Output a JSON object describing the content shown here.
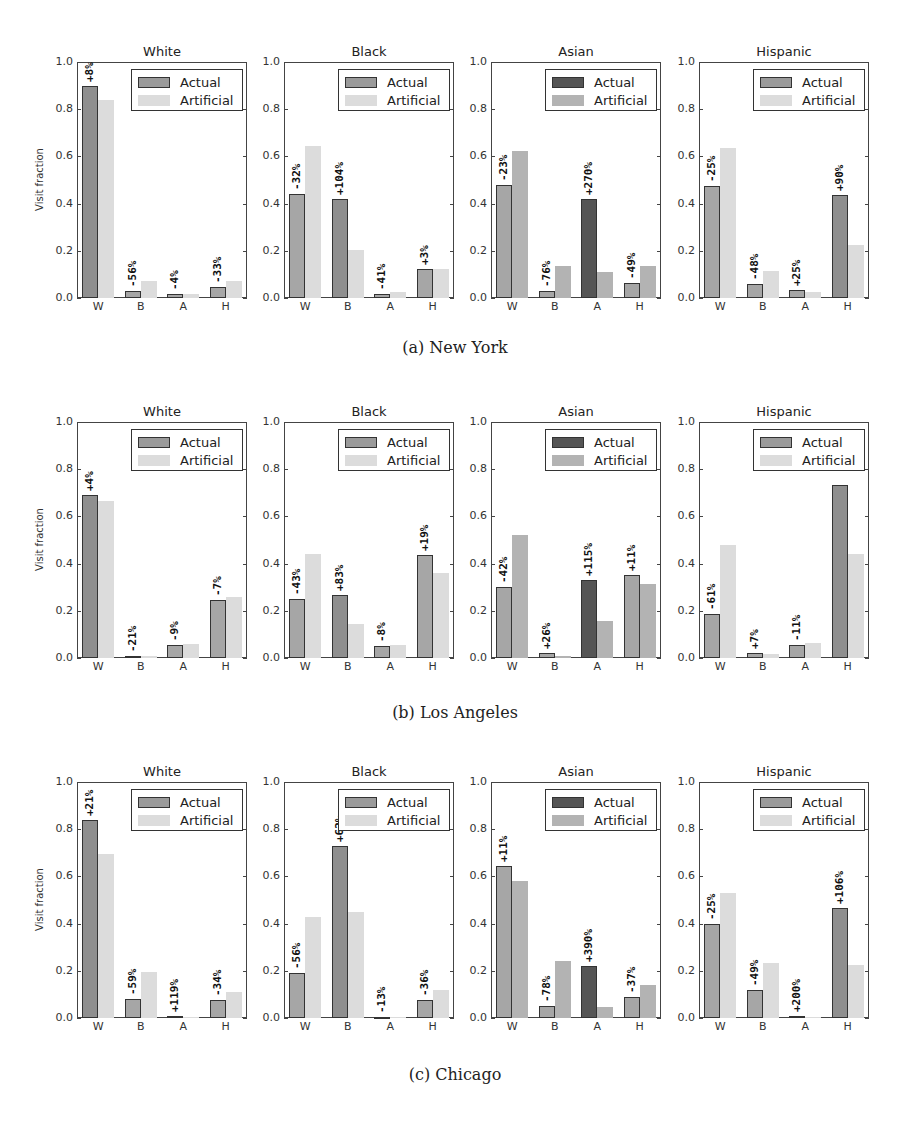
{
  "colors": {
    "actual": "#a6a6a6",
    "actual_highlight": "#555555",
    "artificial": "#dcdcdc",
    "artificial_on_highlight": "#b3b3b3"
  },
  "legend": {
    "actual": "Actual",
    "artificial": "Artificial"
  },
  "ylabel": "Visit fraction",
  "yticks": [
    "0.0",
    "0.2",
    "0.4",
    "0.6",
    "0.8",
    "1.0"
  ],
  "xticks": [
    "W",
    "B",
    "A",
    "H"
  ],
  "captions": [
    "(a) New York",
    "(b) Los Angeles",
    "(c) Chicago"
  ],
  "chart_data": [
    {
      "type": "bar",
      "city": "New York",
      "title": "White",
      "xlabel": "",
      "ylabel": "Visit fraction",
      "ylim": [
        0,
        1
      ],
      "categories": [
        "W",
        "B",
        "A",
        "H"
      ],
      "series": [
        {
          "name": "Actual",
          "values": [
            0.9,
            0.03,
            0.015,
            0.045
          ]
        },
        {
          "name": "Artificial",
          "values": [
            0.84,
            0.07,
            0.015,
            0.07
          ]
        }
      ],
      "annotations": [
        "+8%",
        "-56%",
        "-4%",
        "-33%"
      ],
      "highlight": 0,
      "legend_position": "upper right"
    },
    {
      "type": "bar",
      "city": "New York",
      "title": "Black",
      "ylim": [
        0,
        1
      ],
      "categories": [
        "W",
        "B",
        "A",
        "H"
      ],
      "series": [
        {
          "name": "Actual",
          "values": [
            0.44,
            0.42,
            0.015,
            0.125
          ]
        },
        {
          "name": "Artificial",
          "values": [
            0.645,
            0.205,
            0.025,
            0.125
          ]
        }
      ],
      "annotations": [
        "-32%",
        "+104%",
        "-41%",
        "+3%"
      ],
      "highlight": 1,
      "legend_position": "upper right"
    },
    {
      "type": "bar",
      "city": "New York",
      "title": "Asian",
      "ylim": [
        0,
        1
      ],
      "categories": [
        "W",
        "B",
        "A",
        "H"
      ],
      "series": [
        {
          "name": "Actual",
          "values": [
            0.48,
            0.03,
            0.42,
            0.065
          ]
        },
        {
          "name": "Artificial",
          "values": [
            0.625,
            0.135,
            0.11,
            0.135
          ]
        }
      ],
      "annotations": [
        "-23%",
        "-76%",
        "+270%",
        "-49%"
      ],
      "highlight": 2,
      "legend_position": "upper right"
    },
    {
      "type": "bar",
      "city": "New York",
      "title": "Hispanic",
      "ylim": [
        0,
        1
      ],
      "categories": [
        "W",
        "B",
        "A",
        "H"
      ],
      "series": [
        {
          "name": "Actual",
          "values": [
            0.475,
            0.06,
            0.035,
            0.435
          ]
        },
        {
          "name": "Artificial",
          "values": [
            0.635,
            0.115,
            0.025,
            0.225
          ]
        }
      ],
      "annotations": [
        "-25%",
        "-48%",
        "+25%",
        "+90%"
      ],
      "highlight": 3,
      "legend_position": "upper right"
    },
    {
      "type": "bar",
      "city": "Los Angeles",
      "title": "White",
      "ylim": [
        0,
        1
      ],
      "categories": [
        "W",
        "B",
        "A",
        "H"
      ],
      "series": [
        {
          "name": "Actual",
          "values": [
            0.69,
            0.01,
            0.055,
            0.245
          ]
        },
        {
          "name": "Artificial",
          "values": [
            0.665,
            0.01,
            0.06,
            0.26
          ]
        }
      ],
      "annotations": [
        "+4%",
        "-21%",
        "-9%",
        "-7%"
      ],
      "highlight": 0,
      "legend_position": "upper right"
    },
    {
      "type": "bar",
      "city": "Los Angeles",
      "title": "Black",
      "ylim": [
        0,
        1
      ],
      "categories": [
        "W",
        "B",
        "A",
        "H"
      ],
      "series": [
        {
          "name": "Actual",
          "values": [
            0.25,
            0.265,
            0.05,
            0.435
          ]
        },
        {
          "name": "Artificial",
          "values": [
            0.44,
            0.145,
            0.055,
            0.36
          ]
        }
      ],
      "annotations": [
        "-43%",
        "+83%",
        "-8%",
        "+19%"
      ],
      "highlight": 1,
      "legend_position": "upper right"
    },
    {
      "type": "bar",
      "city": "Los Angeles",
      "title": "Asian",
      "ylim": [
        0,
        1
      ],
      "categories": [
        "W",
        "B",
        "A",
        "H"
      ],
      "series": [
        {
          "name": "Actual",
          "values": [
            0.3,
            0.02,
            0.33,
            0.35
          ]
        },
        {
          "name": "Artificial",
          "values": [
            0.52,
            0.01,
            0.155,
            0.315
          ]
        }
      ],
      "annotations": [
        "-42%",
        "+26%",
        "+115%",
        "+11%"
      ],
      "highlight": 2,
      "legend_position": "upper right"
    },
    {
      "type": "bar",
      "city": "Los Angeles",
      "title": "Hispanic",
      "ylim": [
        0,
        1
      ],
      "categories": [
        "W",
        "B",
        "A",
        "H"
      ],
      "series": [
        {
          "name": "Actual",
          "values": [
            0.185,
            0.02,
            0.055,
            0.735
          ]
        },
        {
          "name": "Artificial",
          "values": [
            0.48,
            0.015,
            0.065,
            0.44
          ]
        }
      ],
      "annotations": [
        "-61%",
        "+7%",
        "-11%",
        ""
      ],
      "highlight": 3,
      "legend_position": "upper right"
    },
    {
      "type": "bar",
      "city": "Chicago",
      "title": "White",
      "ylim": [
        0,
        1
      ],
      "categories": [
        "W",
        "B",
        "A",
        "H"
      ],
      "series": [
        {
          "name": "Actual",
          "values": [
            0.84,
            0.08,
            0.01,
            0.075
          ]
        },
        {
          "name": "Artificial",
          "values": [
            0.695,
            0.195,
            0.005,
            0.11
          ]
        }
      ],
      "annotations": [
        "+21%",
        "-59%",
        "+119%",
        "-34%"
      ],
      "highlight": 0,
      "legend_position": "upper right"
    },
    {
      "type": "bar",
      "city": "Chicago",
      "title": "Black",
      "ylim": [
        0,
        1
      ],
      "categories": [
        "W",
        "B",
        "A",
        "H"
      ],
      "series": [
        {
          "name": "Actual",
          "values": [
            0.19,
            0.73,
            0.004,
            0.075
          ]
        },
        {
          "name": "Artificial",
          "values": [
            0.43,
            0.45,
            0.004,
            0.12
          ]
        }
      ],
      "annotations": [
        "-56%",
        "+62%",
        "-13%",
        "-36%"
      ],
      "highlight": 1,
      "legend_position": "upper right"
    },
    {
      "type": "bar",
      "city": "Chicago",
      "title": "Asian",
      "ylim": [
        0,
        1
      ],
      "categories": [
        "W",
        "B",
        "A",
        "H"
      ],
      "series": [
        {
          "name": "Actual",
          "values": [
            0.645,
            0.05,
            0.22,
            0.09
          ]
        },
        {
          "name": "Artificial",
          "values": [
            0.58,
            0.24,
            0.045,
            0.14
          ]
        }
      ],
      "annotations": [
        "+11%",
        "-78%",
        "+390%",
        "-37%"
      ],
      "highlight": 2,
      "legend_position": "upper right"
    },
    {
      "type": "bar",
      "city": "Chicago",
      "title": "Hispanic",
      "ylim": [
        0,
        1
      ],
      "categories": [
        "W",
        "B",
        "A",
        "H"
      ],
      "series": [
        {
          "name": "Actual",
          "values": [
            0.4,
            0.12,
            0.01,
            0.465
          ]
        },
        {
          "name": "Artificial",
          "values": [
            0.53,
            0.235,
            0.003,
            0.225
          ]
        }
      ],
      "annotations": [
        "-25%",
        "-49%",
        "+200%",
        "+106%"
      ],
      "highlight": 3,
      "legend_position": "upper right"
    }
  ]
}
